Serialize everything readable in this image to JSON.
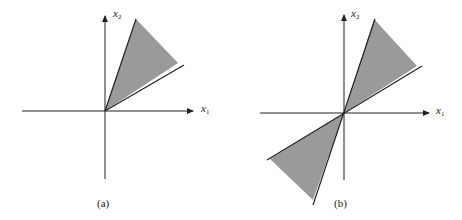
{
  "figure": {
    "panels": [
      {
        "id": "a",
        "caption": "(a)",
        "x_axis_label": "x",
        "x_axis_sub": "1",
        "y_axis_label": "x",
        "y_axis_sub": "2",
        "region": "cone in first quadrant (single wedge)"
      },
      {
        "id": "b",
        "caption": "(b)",
        "x_axis_label": "x",
        "x_axis_sub": "1",
        "y_axis_label": "x",
        "y_axis_sub": "2",
        "region": "double wedge through origin (first and third quadrants)"
      }
    ],
    "colors": {
      "fill": "#9a9a9a",
      "line": "#222222",
      "background": "#ffffff"
    }
  }
}
